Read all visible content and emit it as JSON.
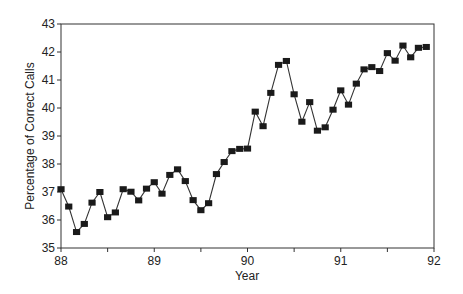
{
  "chart_data": {
    "type": "line",
    "title": "",
    "xlabel": "Year",
    "ylabel": "Percentage of Correct Calls",
    "xlim": [
      88,
      92
    ],
    "ylim": [
      35,
      43
    ],
    "x_ticks": [
      "88",
      "89",
      "90",
      "91",
      "92"
    ],
    "y_ticks": [
      "35",
      "36",
      "37",
      "38",
      "39",
      "40",
      "41",
      "42",
      "43"
    ],
    "grid": false,
    "legend": null,
    "marker": "square",
    "series": [
      {
        "name": "Percentage of Correct Calls",
        "x_unit": "monthly, starting 88.0",
        "x": [
          88.0,
          88.083,
          88.167,
          88.25,
          88.333,
          88.417,
          88.5,
          88.583,
          88.667,
          88.75,
          88.833,
          88.917,
          89.0,
          89.083,
          89.167,
          89.25,
          89.333,
          89.417,
          89.5,
          89.583,
          89.667,
          89.75,
          89.833,
          89.917,
          90.0,
          90.083,
          90.167,
          90.25,
          90.333,
          90.417,
          90.5,
          90.583,
          90.667,
          90.75,
          90.833,
          90.917,
          91.0,
          91.083,
          91.167,
          91.25,
          91.333,
          91.417,
          91.5,
          91.583,
          91.667,
          91.75,
          91.833,
          91.917
        ],
        "values": [
          37.1,
          36.48,
          35.57,
          35.86,
          36.62,
          37.0,
          36.1,
          36.27,
          37.1,
          37.01,
          36.7,
          37.12,
          37.35,
          36.94,
          37.61,
          37.81,
          37.39,
          36.71,
          36.35,
          36.6,
          37.64,
          38.07,
          38.46,
          38.54,
          38.55,
          39.87,
          39.35,
          40.54,
          41.54,
          41.68,
          40.49,
          39.51,
          40.21,
          39.19,
          39.31,
          39.94,
          40.63,
          40.12,
          40.87,
          41.38,
          41.46,
          41.32,
          41.96,
          41.69,
          42.23,
          41.81,
          42.15,
          42.18
        ]
      }
    ]
  }
}
